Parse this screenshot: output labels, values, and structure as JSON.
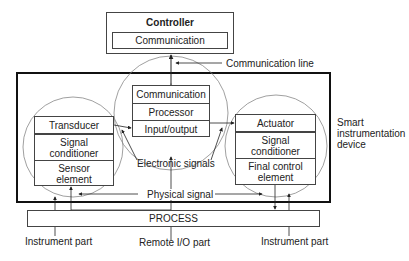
{
  "diagram": {
    "controller": {
      "title": "Controller",
      "communication": "Communication"
    },
    "communication_line_label": "Communication line",
    "smart_device_label_lines": [
      "Smart",
      "instrumentation",
      "device"
    ],
    "remote_io": {
      "cells": [
        "Communication",
        "Processor",
        "Input/output"
      ]
    },
    "sensor_instrument": {
      "cells": [
        "Transducer",
        "Signal conditioner",
        "Sensor element"
      ]
    },
    "actuator_instrument": {
      "cells": [
        "Actuator",
        "Signal conditioner",
        "Final control element"
      ]
    },
    "electronic_signals_label": "Electronic signals",
    "physical_signal_label": "Physical signal",
    "process_label": "PROCESS",
    "bottom_labels": {
      "left": "Instrument part",
      "center": "Remote I/O part",
      "right": "Instrument part"
    },
    "colors": {
      "line": "#444444",
      "circle": "#888888",
      "frame": "#111111",
      "text": "#222222"
    }
  }
}
